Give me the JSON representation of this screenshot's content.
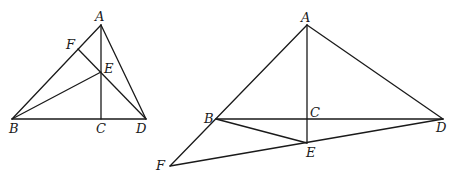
{
  "figures": [
    {
      "id": "figure-1",
      "points": {
        "A": {
          "x": 101,
          "y": 25
        },
        "B": {
          "x": 12,
          "y": 119
        },
        "C": {
          "x": 101,
          "y": 119
        },
        "D": {
          "x": 146,
          "y": 119
        },
        "E": {
          "x": 101,
          "y": 72
        },
        "F": {
          "x": 78,
          "y": 49
        }
      },
      "labels": {
        "A": {
          "text": "A",
          "x": 95,
          "y": 21
        },
        "B": {
          "text": "B",
          "x": 9,
          "y": 133
        },
        "C": {
          "text": "C",
          "x": 96,
          "y": 133
        },
        "D": {
          "text": "D",
          "x": 136,
          "y": 133
        },
        "E": {
          "text": "E",
          "x": 104,
          "y": 73
        },
        "F": {
          "text": "F",
          "x": 66,
          "y": 49
        }
      },
      "segments": [
        [
          "A",
          "B"
        ],
        [
          "A",
          "D"
        ],
        [
          "B",
          "D"
        ],
        [
          "A",
          "C"
        ],
        [
          "F",
          "D"
        ],
        [
          "B",
          "E"
        ]
      ]
    },
    {
      "id": "figure-2",
      "points": {
        "A": {
          "x": 307,
          "y": 25
        },
        "B": {
          "x": 216,
          "y": 119
        },
        "C": {
          "x": 307,
          "y": 119
        },
        "D": {
          "x": 443,
          "y": 119
        },
        "E": {
          "x": 307,
          "y": 143
        },
        "F": {
          "x": 170,
          "y": 166
        }
      },
      "labels": {
        "A": {
          "text": "A",
          "x": 301,
          "y": 22
        },
        "B": {
          "text": "B",
          "x": 204,
          "y": 123
        },
        "C": {
          "text": "C",
          "x": 310,
          "y": 117
        },
        "D": {
          "text": "D",
          "x": 436,
          "y": 132
        },
        "E": {
          "text": "E",
          "x": 306,
          "y": 157
        },
        "F": {
          "text": "F",
          "x": 156,
          "y": 170
        }
      },
      "segments": [
        [
          "A",
          "F"
        ],
        [
          "A",
          "D"
        ],
        [
          "B",
          "D"
        ],
        [
          "A",
          "E"
        ],
        [
          "B",
          "E"
        ],
        [
          "F",
          "D"
        ]
      ]
    }
  ],
  "style": {
    "stroke": "#1a1a1a",
    "background": "#ffffff"
  }
}
